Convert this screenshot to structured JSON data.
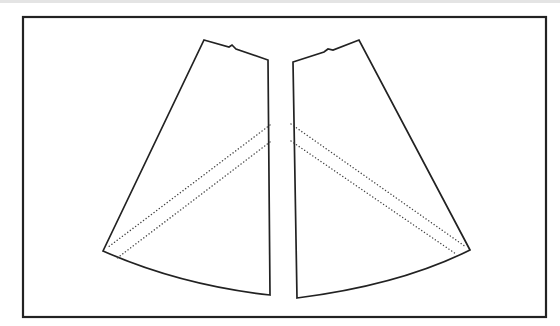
{
  "diagram": {
    "type": "sewing-pattern",
    "description": "Two mirrored flared skirt panels inside a rectangular frame, each with a top waist notch and two diagonal dotted bias/fold lines",
    "colors": {
      "line": "#222222",
      "dotted": "#444444",
      "background": "#ffffff",
      "top_strip": "#e4e4e4"
    },
    "frame": {
      "x": 23,
      "y": 17,
      "width": 523,
      "height": 300
    },
    "pieces": [
      {
        "name": "left-panel",
        "outline": "M204,40 L229,47 L232,45 L236,49 L268,60 L270,295 Q180,285 103,251 Z",
        "dotted_lines": [
          {
            "from": [
              270,
              125
            ],
            "to": [
              107,
              248
            ]
          },
          {
            "from": [
              270,
              142
            ],
            "to": [
              116,
              259
            ]
          }
        ]
      },
      {
        "name": "right-panel",
        "outline": "M293,62 L324,52 L328,49 L333,50 L359,40 L470,250 Q400,285 297,298 Z",
        "dotted_lines": [
          {
            "from": [
              291,
              124
            ],
            "to": [
              466,
              247
            ]
          },
          {
            "from": [
              291,
              141
            ],
            "to": [
              456,
              254
            ]
          }
        ]
      }
    ]
  }
}
